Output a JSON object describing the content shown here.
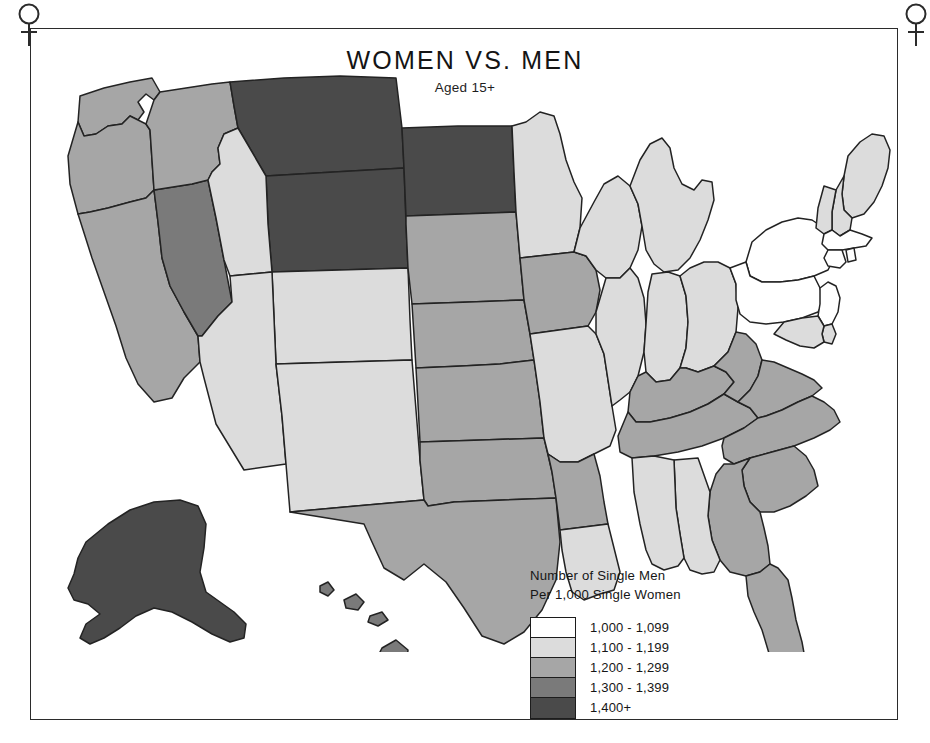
{
  "title": "WOMEN VS. MEN",
  "subtitle": "Aged 15+",
  "frame": {
    "corner_icon_left": "venus-symbol",
    "corner_icon_right": "venus-symbol"
  },
  "legend": {
    "caption_line1": "Number of Single Men",
    "caption_line2": "Per 1,000 Single Women",
    "items": [
      {
        "label": "1,000 - 1,099",
        "color": "#ffffff"
      },
      {
        "label": "1,100 - 1,199",
        "color": "#dcdcdc"
      },
      {
        "label": "1,200 - 1,299",
        "color": "#a6a6a6"
      },
      {
        "label": "1,300 - 1,399",
        "color": "#7a7a7a"
      },
      {
        "label": "1,400+",
        "color": "#4a4a4a"
      }
    ]
  },
  "chart_data": {
    "type": "map",
    "title": "WOMEN VS. MEN",
    "subtitle": "Aged 15+",
    "measure": "Number of Single Men Per 1,000 Single Women",
    "region": "United States",
    "projection": "albers-usa",
    "bins": [
      {
        "label": "1,000 - 1,099",
        "min": 1000,
        "max": 1099,
        "color": "#ffffff"
      },
      {
        "label": "1,100 - 1,199",
        "min": 1100,
        "max": 1199,
        "color": "#dcdcdc"
      },
      {
        "label": "1,200 - 1,299",
        "min": 1200,
        "max": 1299,
        "color": "#a6a6a6"
      },
      {
        "label": "1,300 - 1,399",
        "min": 1300,
        "max": 1399,
        "color": "#7a7a7a"
      },
      {
        "label": "1,400+",
        "min": 1400,
        "max": null,
        "color": "#4a4a4a"
      }
    ],
    "values": {
      "AK": "1,400+",
      "AL": "1,100 - 1,199",
      "AR": "1,200 - 1,299",
      "AZ": "1,100 - 1,199",
      "CA": "1,200 - 1,299",
      "CO": "1,100 - 1,199",
      "CT": "1,000 - 1,099",
      "DE": "1,100 - 1,199",
      "FL": "1,200 - 1,299",
      "GA": "1,200 - 1,299",
      "HI": "1,300 - 1,399",
      "IA": "1,200 - 1,299",
      "ID": "1,200 - 1,299",
      "IL": "1,100 - 1,199",
      "IN": "1,100 - 1,199",
      "KS": "1,200 - 1,299",
      "KY": "1,200 - 1,299",
      "LA": "1,100 - 1,199",
      "MA": "1,000 - 1,099",
      "MD": "1,100 - 1,199",
      "ME": "1,100 - 1,199",
      "MI": "1,100 - 1,199",
      "MN": "1,100 - 1,199",
      "MO": "1,100 - 1,199",
      "MS": "1,100 - 1,199",
      "MT": "1,400+",
      "NC": "1,200 - 1,299",
      "ND": "1,400+",
      "NE": "1,200 - 1,299",
      "NH": "1,100 - 1,199",
      "NJ": "1,000 - 1,099",
      "NM": "1,100 - 1,199",
      "NV": "1,300 - 1,399",
      "NY": "1,000 - 1,099",
      "OH": "1,100 - 1,199",
      "OK": "1,200 - 1,299",
      "OR": "1,200 - 1,299",
      "PA": "1,000 - 1,099",
      "RI": "1,000 - 1,099",
      "SC": "1,200 - 1,299",
      "SD": "1,200 - 1,299",
      "TN": "1,200 - 1,299",
      "TX": "1,200 - 1,299",
      "UT": "1,100 - 1,199",
      "VA": "1,200 - 1,299",
      "VT": "1,100 - 1,199",
      "WA": "1,200 - 1,299",
      "WI": "1,100 - 1,199",
      "WV": "1,200 - 1,299",
      "WY": "1,400+"
    }
  }
}
